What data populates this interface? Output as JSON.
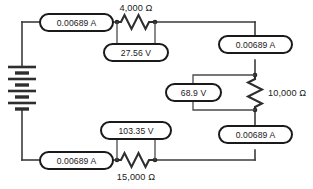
{
  "diagram": {
    "type": "electrical-schematic",
    "colors": {
      "wire": "#3b3b3b",
      "component": "#2e2e2e",
      "text": "#1a1a1a",
      "background": "#ffffff"
    }
  },
  "source": {
    "name": "battery",
    "symbol": "multi-cell-battery",
    "cells": 4
  },
  "components": {
    "resistor_top": {
      "name": "resistor-4000-ohm",
      "value": "4,000",
      "unit": "Ω",
      "label": "4,000  Ω",
      "orientation": "horizontal",
      "label_position": "above"
    },
    "resistor_right": {
      "name": "resistor-10000-ohm",
      "value": "10,000",
      "unit": "Ω",
      "label": "10,000  Ω",
      "orientation": "vertical",
      "label_position": "right"
    },
    "resistor_bottom": {
      "name": "resistor-15000-ohm",
      "value": "15,000",
      "unit": "Ω",
      "label": "15,000  Ω",
      "orientation": "horizontal",
      "label_position": "below"
    }
  },
  "meters": {
    "ammeter_top_left": {
      "name": "ammeter-top-left",
      "kind": "ammeter",
      "reading": "0.00689",
      "unit": "A",
      "label": "0.00689 A"
    },
    "ammeter_right_top": {
      "name": "ammeter-right-top",
      "kind": "ammeter",
      "reading": "0.00689",
      "unit": "A",
      "label": "0.00689 A"
    },
    "ammeter_right_bottom": {
      "name": "ammeter-right-bottom",
      "kind": "ammeter",
      "reading": "0.00689",
      "unit": "A",
      "label": "0.00689 A"
    },
    "ammeter_bottom_left": {
      "name": "ammeter-bottom-left",
      "kind": "ammeter",
      "reading": "0.00689",
      "unit": "A",
      "label": "0.00689 A"
    },
    "voltmeter_top": {
      "name": "voltmeter-across-4000-ohm",
      "kind": "voltmeter",
      "reading": "27.56",
      "unit": "V",
      "label": "27.56  V"
    },
    "voltmeter_right": {
      "name": "voltmeter-across-10000-ohm",
      "kind": "voltmeter",
      "reading": "68.9",
      "unit": "V",
      "label": "68.9  V"
    },
    "voltmeter_bottom": {
      "name": "voltmeter-across-15000-ohm",
      "kind": "voltmeter",
      "reading": "103.35",
      "unit": "V",
      "label": "103.35  V"
    }
  }
}
